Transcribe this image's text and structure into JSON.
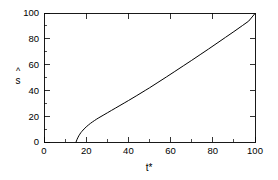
{
  "chart_data": {
    "type": "line",
    "title": "",
    "subtitle": "",
    "xlabel": "t*",
    "ylabel": "s",
    "ylabel_accent": "^",
    "ylabel_display": "ŝ",
    "xlim": [
      0,
      100
    ],
    "ylim": [
      0,
      100
    ],
    "x_major_ticks": [
      0,
      20,
      40,
      60,
      80,
      100
    ],
    "y_major_ticks": [
      0,
      20,
      40,
      60,
      80,
      100
    ],
    "x_minor_ticks": [
      10,
      30,
      50,
      70,
      90
    ],
    "y_minor_ticks": [
      10,
      30,
      50,
      70,
      90
    ],
    "x_tick_labels": [
      "0",
      "20",
      "40",
      "60",
      "80",
      "100"
    ],
    "y_tick_labels": [
      "0",
      "20",
      "40",
      "60",
      "80",
      "100"
    ],
    "grid": false,
    "legend": false,
    "legend_position": "none",
    "tick_direction": "in",
    "frame": "box",
    "background_color": "#ffffff",
    "line_color": "#000000",
    "series": [
      {
        "name": "s-hat",
        "color": "#000000",
        "x": [
          15.2,
          15.6,
          16.0,
          16.5,
          17.0,
          17.5,
          18.0,
          19.0,
          20.0,
          21.0,
          22.0,
          23.0,
          24.0,
          25.0,
          26.0,
          28.0,
          30.0,
          32.0,
          34.0,
          36.0,
          38.0,
          40.0,
          44.0,
          48.0,
          50.0,
          54.0,
          58.0,
          62.0,
          66.0,
          70.0,
          74.0,
          78.0,
          82.0,
          86.0,
          90.0,
          94.0,
          97.0,
          100.0
        ],
        "y": [
          0.0,
          1.8,
          3.2,
          4.8,
          6.1,
          7.3,
          8.3,
          10.1,
          11.7,
          13.1,
          14.4,
          15.6,
          16.7,
          17.8,
          18.8,
          20.7,
          22.6,
          24.5,
          26.4,
          28.3,
          30.2,
          32.1,
          36.0,
          40.0,
          42.0,
          46.2,
          50.4,
          54.7,
          59.0,
          63.3,
          67.7,
          72.1,
          76.6,
          81.1,
          85.6,
          90.2,
          93.7,
          99.6
        ]
      }
    ]
  },
  "figure": {
    "width_px": 278,
    "height_px": 180
  }
}
